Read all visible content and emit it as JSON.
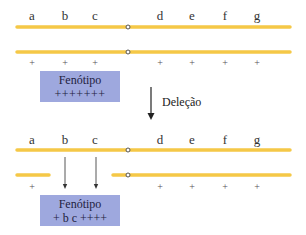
{
  "colors": {
    "chromosome": "#F5C847",
    "phenotype_box": "#9EA8DE",
    "arrow": "#222222",
    "centromere_fill": "#ffffff",
    "centromere_stroke": "#555555"
  },
  "gene_labels": [
    "a",
    "b",
    "c",
    "d",
    "e",
    "f",
    "g"
  ],
  "before": {
    "alleles": [
      "+",
      "+",
      "+",
      "+",
      "+",
      "+",
      "+"
    ],
    "phenotype_title": "Fenótipo",
    "phenotype_value": "+++++++"
  },
  "process_label": "Deleção",
  "after": {
    "deleted_genes": [
      "b",
      "c"
    ],
    "alleles": [
      "+",
      "",
      "",
      "+",
      "+",
      "+",
      "+"
    ],
    "phenotype_title": "Fenótipo",
    "phenotype_value": "+ b c ++++"
  }
}
